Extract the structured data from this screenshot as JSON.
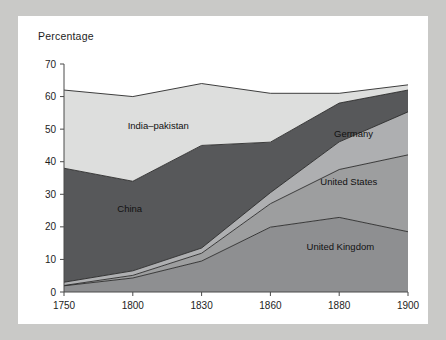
{
  "figure": {
    "axis_title": "Percentage",
    "background_color": "#ffffff",
    "page_background_color": "#c9c9c7"
  },
  "chart_data": {
    "type": "area",
    "stacked": true,
    "title": "",
    "subtitle": "",
    "xlabel": "",
    "ylabel": "Percentage",
    "categories": [
      "1750",
      "1800",
      "1830",
      "1860",
      "1880",
      "1900"
    ],
    "x": [
      1750,
      1800,
      1830,
      1860,
      1880,
      1900
    ],
    "xtick_labels": [
      "1750",
      "1800",
      "1830",
      "1860",
      "1880",
      "1900"
    ],
    "ytick_labels": [
      "0",
      "10",
      "20",
      "30",
      "40",
      "50",
      "60",
      "70"
    ],
    "yticks": [
      0,
      10,
      20,
      30,
      40,
      50,
      60,
      70
    ],
    "ylim": [
      0,
      70
    ],
    "grid": false,
    "legend": "inline-annotations",
    "axis_color": "#4a4a4a",
    "series": [
      {
        "name": "United Kingdom",
        "label": "United Kingdom",
        "color": "#8e8f91",
        "values": [
          1.9,
          4.3,
          9.5,
          19.9,
          22.9,
          18.5
        ]
      },
      {
        "name": "United States",
        "label": "United States",
        "color": "#9d9e9f",
        "values": [
          0.1,
          0.8,
          2.4,
          7.2,
          14.7,
          23.6
        ]
      },
      {
        "name": "Germany",
        "label": "Germany",
        "color": "#aeafb1",
        "values": [
          1.0,
          1.4,
          1.6,
          3.4,
          8.5,
          13.2
        ]
      },
      {
        "name": "China",
        "label": "China",
        "color": "#57585a",
        "values": [
          35.0,
          27.5,
          31.5,
          15.5,
          11.9,
          6.7
        ]
      },
      {
        "name": "India-pakistan",
        "label": "India–pakistan",
        "color": "#dddedd",
        "values": [
          24.0,
          26.0,
          19.0,
          15.0,
          3.0,
          1.6
        ]
      }
    ],
    "series_order_bottom_to_top": [
      "United Kingdom",
      "United States",
      "Germany",
      "China",
      "India-pakistan"
    ],
    "annotations": [
      {
        "text": "India–pakistan",
        "x_frac": 0.185,
        "y_value": 50.0
      },
      {
        "text": "China",
        "x_frac": 0.155,
        "y_value": 24.5
      },
      {
        "text": "Germany",
        "x_frac": 0.785,
        "y_value": 47.5
      },
      {
        "text": "United States",
        "x_frac": 0.745,
        "y_value": 33.0
      },
      {
        "text": "United Kingdom",
        "x_frac": 0.705,
        "y_value": 13.0
      }
    ]
  }
}
